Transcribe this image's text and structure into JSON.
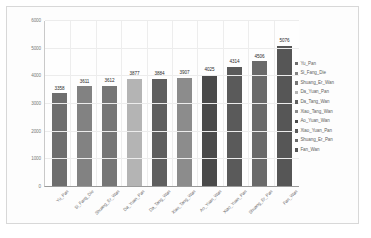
{
  "chart_data": {
    "type": "bar",
    "title": "",
    "xlabel": "",
    "ylabel": "",
    "ylim": [
      0,
      6000
    ],
    "grid": true,
    "legend_position": "right",
    "yticks": [
      "0",
      "1000",
      "2000",
      "3000",
      "4000",
      "5000",
      "6000"
    ],
    "categories": [
      "Yu_Pan",
      "Si_Fang_Die",
      "Shuang_Er_Wan",
      "Da_Yuan_Pan",
      "Da_Tang_Wan",
      "Xiao_Tang_Wan",
      "Ao_Yuan_Wan",
      "Xiao_Yuan_Pan",
      "Shuang_Er_Pan",
      "Fan_Wan"
    ],
    "values": [
      3358,
      3611,
      3612,
      3877,
      3884,
      3907,
      4025,
      4314,
      4506,
      5076
    ],
    "colors": [
      "#6e6e6e",
      "#828282",
      "#767676",
      "#b4b4b4",
      "#5f5f5f",
      "#8c8c8c",
      "#4a4a4a",
      "#5a5a5a",
      "#6a6a6a",
      "#565656"
    ]
  },
  "legend": {
    "items": [
      {
        "label": "Yu_Pan",
        "color": "#6e6e6e"
      },
      {
        "label": "Si_Fang_Die",
        "color": "#828282"
      },
      {
        "label": "Shuang_Er_Wan",
        "color": "#767676"
      },
      {
        "label": "Da_Yuan_Pan",
        "color": "#b4b4b4"
      },
      {
        "label": "Da_Tang_Wan",
        "color": "#5f5f5f"
      },
      {
        "label": "Xiao_Tang_Wan",
        "color": "#8c8c8c"
      },
      {
        "label": "Ao_Yuan_Wan",
        "color": "#4a4a4a"
      },
      {
        "label": "Xiao_Yuan_Pan",
        "color": "#5a5a5a"
      },
      {
        "label": "Shuang_Er_Pan",
        "color": "#6a6a6a"
      },
      {
        "label": "Fan_Wan",
        "color": "#565656"
      }
    ]
  },
  "watermark": {
    "text": ""
  }
}
